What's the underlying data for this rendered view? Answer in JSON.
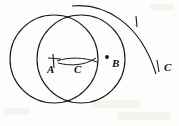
{
  "figure": {
    "background_color": "#fdfdfc",
    "ink_color": "#1a1a1a",
    "labels": [
      {
        "id": "label-a",
        "text": "A",
        "x": 47,
        "y": 64,
        "role": "point-label"
      },
      {
        "id": "label-c-middle",
        "text": "C",
        "x": 74,
        "y": 64,
        "role": "point-label"
      },
      {
        "id": "label-b",
        "text": "B",
        "x": 112,
        "y": 58,
        "role": "point-label"
      },
      {
        "id": "label-c-right",
        "text": "C",
        "x": 164,
        "y": 62,
        "role": "point-label"
      }
    ],
    "points": [
      {
        "id": "point-a",
        "label": "A",
        "cx": 54,
        "cy": 59,
        "marker": "cross"
      },
      {
        "id": "point-b",
        "label": "B",
        "cx": 107,
        "cy": 57,
        "marker": "dot"
      }
    ],
    "circles": [
      {
        "id": "circle-a",
        "center_label": "A",
        "cx": 54,
        "cy": 59,
        "r": 44
      },
      {
        "id": "circle-b",
        "center_label": "B",
        "cx": 81,
        "cy": 59,
        "r": 44
      }
    ],
    "arcs": [
      {
        "id": "arc-right-c",
        "center_label": "C",
        "description": "large right arc passing through marked C"
      },
      {
        "id": "arc-small-upper",
        "description": "small compass arc above AB"
      },
      {
        "id": "arc-small-lower",
        "description": "small compass arc below AB"
      }
    ],
    "tick_marks": [
      {
        "id": "tick-arc-top",
        "x": 136,
        "y": 22,
        "description": "tick on upper right arc"
      },
      {
        "id": "tick-arc-c",
        "x": 158,
        "y": 66,
        "description": "tick at right C point"
      }
    ]
  }
}
